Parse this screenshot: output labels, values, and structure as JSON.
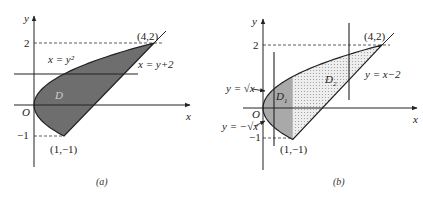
{
  "panels": [
    {
      "id": "a",
      "caption": "(a)",
      "axis_x_label": "x",
      "axis_y_label": "y",
      "origin_label": "O",
      "tick_y_pos": "2",
      "tick_y_neg": "−1",
      "region_label": "D",
      "curve_label": "x = y²",
      "line_label": "x = y+2",
      "point_top": "(4,2)",
      "point_bottom": "(1,−1)",
      "region_fill": "#6e6e6e",
      "cut_line": {
        "orientation": "horizontal",
        "y": 1
      }
    },
    {
      "id": "b",
      "caption": "(b)",
      "axis_x_label": "x",
      "axis_y_label": "y",
      "origin_label": "O",
      "tick_y_pos": "2",
      "tick_y_neg": "−1",
      "region1_label": "D",
      "region1_sub": "1",
      "region2_label": "D",
      "region2_sub": "2",
      "curve_upper_label": "y = √x",
      "curve_lower_label": "y = −√x",
      "line_label": "y = x−2",
      "point_top": "(4,2)",
      "point_bottom": "(1,−1)",
      "region1_fill": "#a9a9a9",
      "region2_fill": "#e6e6e6",
      "cut_lines": [
        {
          "orientation": "vertical",
          "x": 0.4
        },
        {
          "orientation": "vertical",
          "x": 2.9
        }
      ]
    }
  ]
}
